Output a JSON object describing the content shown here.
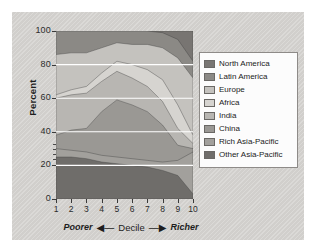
{
  "chart_data": {
    "type": "area",
    "title": "",
    "subtitle": "",
    "xlabel": "Decile",
    "xlabel_left": "Poorer",
    "xlabel_right": "Richer",
    "ylabel": "Percent",
    "ylim": [
      0,
      100
    ],
    "xlim": [
      1,
      10
    ],
    "yticks": [
      0,
      20,
      40,
      60,
      80,
      100
    ],
    "xticks": [
      1,
      2,
      3,
      4,
      5,
      6,
      7,
      8,
      9,
      10
    ],
    "categories": [
      "1",
      "2",
      "3",
      "4",
      "5",
      "6",
      "7",
      "8",
      "9",
      "10"
    ],
    "x": [
      1,
      2,
      3,
      4,
      5,
      6,
      7,
      8,
      9,
      10
    ],
    "stacked": true,
    "grid": "horizontal-white",
    "legend_position": "right",
    "series": [
      {
        "name": "Other Asia-Pacific",
        "color": "#6f6d6a",
        "values": [
          25,
          25,
          24,
          22,
          21,
          20,
          19,
          17,
          14,
          3
        ]
      },
      {
        "name": "Rich Asia-Pacific",
        "color": "#a2a09c",
        "values": [
          5,
          4,
          4,
          4,
          4,
          4,
          4,
          5,
          9,
          25
        ]
      },
      {
        "name": "China",
        "color": "#9a9894",
        "values": [
          8,
          12,
          14,
          26,
          34,
          32,
          29,
          22,
          9,
          2
        ]
      },
      {
        "name": "India",
        "color": "#b8b6b2",
        "values": [
          22,
          21,
          21,
          18,
          17,
          16,
          15,
          14,
          10,
          3
        ]
      },
      {
        "name": "Africa",
        "color": "#d6d4d0",
        "values": [
          2,
          3,
          4,
          5,
          6,
          8,
          10,
          13,
          14,
          5
        ]
      },
      {
        "name": "Europe",
        "color": "#c4c2be",
        "values": [
          24,
          22,
          20,
          15,
          11,
          12,
          15,
          19,
          28,
          34
        ]
      },
      {
        "name": "Latin America",
        "color": "#8b8985",
        "values": [
          14,
          13,
          13,
          10,
          7,
          8,
          8,
          9,
          11,
          10
        ]
      },
      {
        "name": "North America",
        "color": "#787572",
        "values": [
          0,
          0,
          0,
          0,
          0,
          0,
          0,
          1,
          5,
          18
        ]
      }
    ]
  },
  "legend": {
    "items": [
      {
        "label": "North America",
        "color": "#787572"
      },
      {
        "label": "Latin America",
        "color": "#8b8985"
      },
      {
        "label": "Europe",
        "color": "#c4c2be"
      },
      {
        "label": "Africa",
        "color": "#d6d4d0"
      },
      {
        "label": "India",
        "color": "#b8b6b2"
      },
      {
        "label": "China",
        "color": "#9a9894"
      },
      {
        "label": "Rich Asia-Pacific",
        "color": "#a2a09c"
      },
      {
        "label": "Other Asia-Pacific",
        "color": "#6f6d6a"
      }
    ]
  },
  "axes": {
    "y_label": "Percent",
    "y_ticks": [
      "100",
      "80",
      "60",
      "40",
      "20",
      "0"
    ],
    "x_ticks": [
      "1",
      "2",
      "3",
      "4",
      "5",
      "6",
      "7",
      "8",
      "9",
      "10"
    ],
    "x_caption_left": "Poorer",
    "x_caption_center": "Decile",
    "x_caption_right": "Richer",
    "arrow_left": "◀—",
    "arrow_right": "—▶"
  },
  "colors": {
    "panel": "#d6d4d1",
    "plot_background": "#b5b3af",
    "gridline": "#ffffff",
    "axis": "#3a3a3a",
    "text": "#1d1d1d"
  }
}
